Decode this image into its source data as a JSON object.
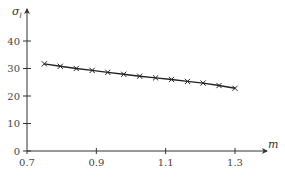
{
  "chart_data": {
    "type": "line",
    "title": "",
    "xlabel": "m",
    "ylabel": "σ",
    "ylabel_subscript": "l",
    "xlim": [
      0.7,
      1.4
    ],
    "ylim": [
      0,
      50
    ],
    "xticks": [
      0.7,
      0.9,
      1.1,
      1.3
    ],
    "xtick_labels": [
      "0.7",
      "0.9",
      "1.1",
      "1.3"
    ],
    "yticks": [
      0,
      10,
      20,
      30,
      40
    ],
    "ytick_labels": [
      "0",
      "10",
      "20",
      "30",
      "40"
    ],
    "grid": false,
    "legend": null,
    "series": [
      {
        "name": "σ_l",
        "marker": "x",
        "x": [
          0.75,
          0.796,
          0.842,
          0.888,
          0.933,
          0.979,
          1.025,
          1.071,
          1.117,
          1.163,
          1.208,
          1.254,
          1.3
        ],
        "y": [
          31.7,
          30.8,
          30.0,
          29.3,
          28.6,
          27.9,
          27.2,
          26.6,
          26.0,
          25.3,
          24.7,
          23.8,
          22.8
        ]
      }
    ]
  }
}
